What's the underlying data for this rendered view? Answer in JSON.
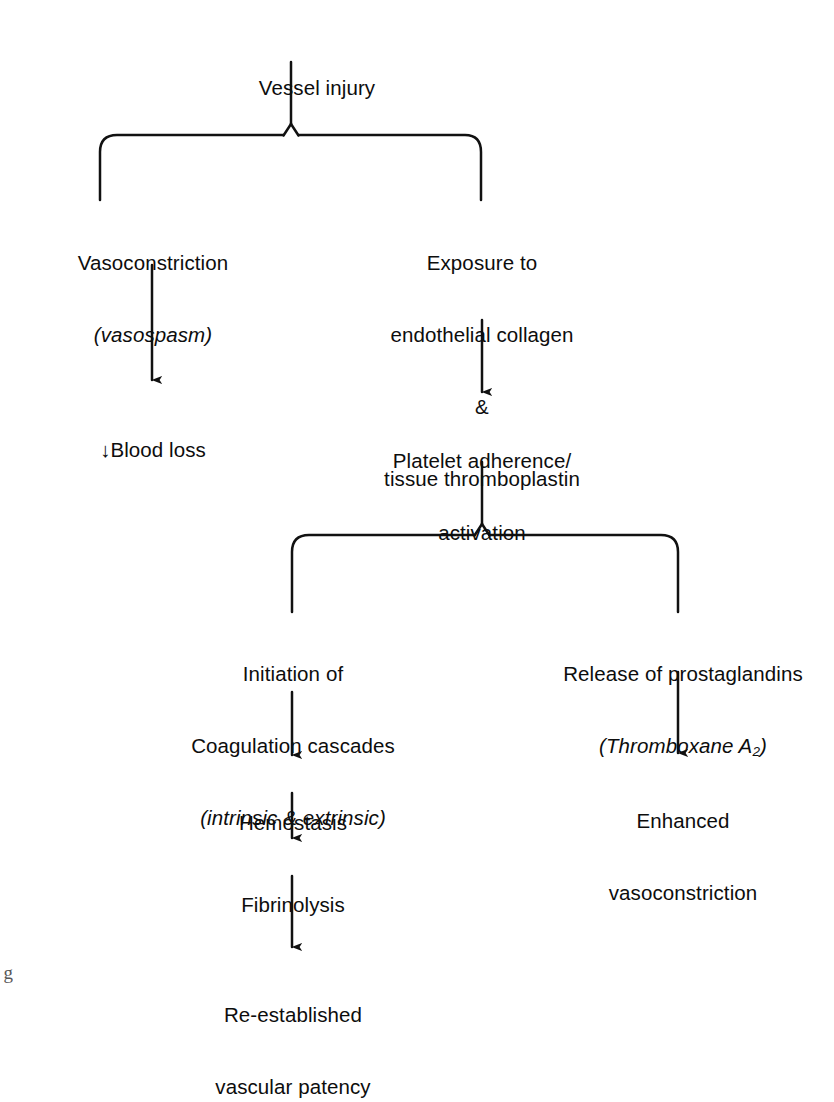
{
  "diagram": {
    "background_color": "#ffffff",
    "line_color": "#111111",
    "text_color": "#0d0d0d",
    "margin_note": "g",
    "nodes": {
      "vessel_injury": {
        "line1": "Vessel injury"
      },
      "vasoconstriction": {
        "line1": "Vasoconstriction",
        "line2": "(vasospasm)"
      },
      "blood_loss": {
        "line1": "↓Blood loss"
      },
      "exposure": {
        "line1": "Exposure to",
        "line2": "endothelial collagen",
        "line3": "&",
        "line4": "tissue thromboplastin"
      },
      "platelet": {
        "line1": "Platelet adherence/",
        "line2": "activation"
      },
      "initiation": {
        "line1": "Initiation of",
        "line2": "Coagulation cascades",
        "line3": "(intrinsic & extrinsic)"
      },
      "hemostasis": {
        "line1": "Hemostasis"
      },
      "fibrinolysis": {
        "line1": "Fibrinolysis"
      },
      "reestablished": {
        "line1": "Re-established",
        "line2": "vascular patency"
      },
      "release": {
        "line1": "Release of prostaglandins",
        "line2_prefix": "(Thromboxane A",
        "line2_sub": "2",
        "line2_suffix": ")"
      },
      "enhanced": {
        "line1": "Enhanced",
        "line2": "vasoconstriction"
      }
    },
    "edges": [
      {
        "from": "vessel_injury",
        "to": "vasoconstriction",
        "kind": "split-branch-left"
      },
      {
        "from": "vessel_injury",
        "to": "exposure",
        "kind": "split-branch-right"
      },
      {
        "from": "vasoconstriction",
        "to": "blood_loss",
        "kind": "arrow"
      },
      {
        "from": "exposure",
        "to": "platelet",
        "kind": "arrow"
      },
      {
        "from": "platelet",
        "to": "initiation",
        "kind": "split-branch-left"
      },
      {
        "from": "platelet",
        "to": "release",
        "kind": "split-branch-right"
      },
      {
        "from": "initiation",
        "to": "hemostasis",
        "kind": "arrow"
      },
      {
        "from": "hemostasis",
        "to": "fibrinolysis",
        "kind": "arrow"
      },
      {
        "from": "fibrinolysis",
        "to": "reestablished",
        "kind": "arrow"
      },
      {
        "from": "release",
        "to": "enhanced",
        "kind": "arrow"
      }
    ]
  }
}
